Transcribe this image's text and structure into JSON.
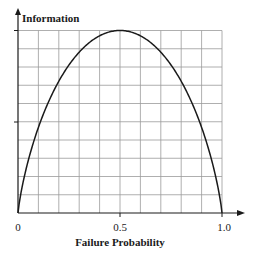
{
  "chart_data": {
    "type": "line",
    "title": "",
    "xlabel": "Failure Probability",
    "ylabel": "Information",
    "xlim": [
      0,
      1.0
    ],
    "ylim": [
      0,
      1.0
    ],
    "x_ticks": [
      "0",
      "0.5",
      "1.0"
    ],
    "y_ticks": [],
    "grid": true,
    "grid_divisions": {
      "x": 10,
      "y": 10
    },
    "legend": null,
    "series": [
      {
        "name": "Information (binary entropy)",
        "x": [
          0,
          0.05,
          0.1,
          0.15,
          0.2,
          0.25,
          0.3,
          0.35,
          0.4,
          0.45,
          0.5,
          0.55,
          0.6,
          0.65,
          0.7,
          0.75,
          0.8,
          0.85,
          0.9,
          0.95,
          1.0
        ],
        "values": [
          0,
          0.29,
          0.47,
          0.61,
          0.72,
          0.81,
          0.88,
          0.93,
          0.97,
          0.99,
          1.0,
          0.99,
          0.97,
          0.93,
          0.88,
          0.81,
          0.72,
          0.61,
          0.47,
          0.29,
          0
        ]
      }
    ]
  },
  "labels": {
    "ylabel": "Information",
    "xlabel": "Failure Probability",
    "tick_0": "0",
    "tick_05": "0.5",
    "tick_10": "1.0"
  },
  "colors": {
    "grid": "#9a9a9a",
    "axis": "#1a1a1a",
    "curve": "#1a1a1a"
  }
}
